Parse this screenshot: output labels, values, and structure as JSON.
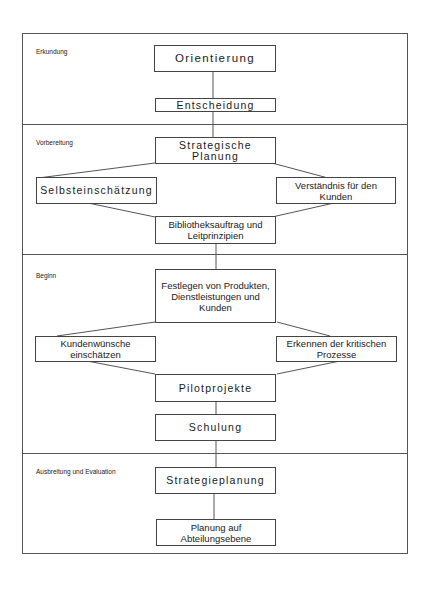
{
  "sections": [
    {
      "label": "Erkundung"
    },
    {
      "label": "Vorbereitung"
    },
    {
      "label": "Beginn"
    },
    {
      "label": "Ausbreitung und Evaluation"
    }
  ],
  "nodes": {
    "orientierung": "Orientierung",
    "entscheidung": "Entscheidung",
    "strategische_planung": "Strategische Planung",
    "selbsteinschaetzung": "Selbsteinschätzung",
    "verstaendnis": "Verständnis für den Kunden",
    "bibliotheksauftrag": "Bibliotheksauftrag und Leitprinzipien",
    "festlegen": "Festlegen von Produkten, Dienstleistungen und Kunden",
    "kundenwuensche": "Kundenwünsche einschätzen",
    "erkennen": "Erkennen der kritischen Prozesse",
    "pilotprojekte": "Pilotprojekte",
    "schulung": "Schulung",
    "strategieplanung": "Strategieplanung",
    "planung_abteilung": "Planung auf Abteilungsebene"
  }
}
